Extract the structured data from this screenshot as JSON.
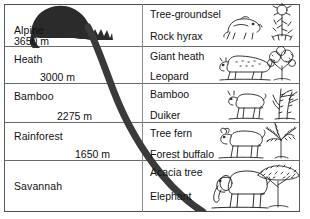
{
  "diagram": {
    "kind": "mountain-zonation"
  },
  "zones": [
    {
      "id": "alpine",
      "name": "Alpine",
      "altitude_label": "3650 m",
      "plant": "Tree-groundsel",
      "animal": "Rock hyrax",
      "illustration_animal": "rock-hyrax-illustration",
      "illustration_plant": "tree-groundsel-illustration"
    },
    {
      "id": "heath",
      "name": "Heath",
      "altitude_label": "3000 m",
      "plant": "Giant heath",
      "animal": "Leopard",
      "illustration_animal": "leopard-illustration",
      "illustration_plant": "giant-heath-illustration"
    },
    {
      "id": "bamboo",
      "name": "Bamboo",
      "altitude_label": "2275 m",
      "plant": "Bamboo",
      "animal": "Duiker",
      "illustration_animal": "duiker-illustration",
      "illustration_plant": "bamboo-illustration"
    },
    {
      "id": "rainforest",
      "name": "Rainforest",
      "altitude_label": "1650 m",
      "plant": "Tree fern",
      "animal": "Forest buffalo",
      "illustration_animal": "forest-buffalo-illustration",
      "illustration_plant": "tree-fern-illustration"
    },
    {
      "id": "savannah",
      "name": "Savannah",
      "altitude_label": "",
      "plant": "Acacia tree",
      "animal": "Elephant",
      "illustration_animal": "elephant-illustration",
      "illustration_plant": "acacia-tree-illustration"
    }
  ],
  "colors": {
    "peak": "#2b2b2b",
    "slope": "#3a3a3a",
    "rule": "#4a4a4a",
    "text": "#111111",
    "background": "#ffffff"
  }
}
